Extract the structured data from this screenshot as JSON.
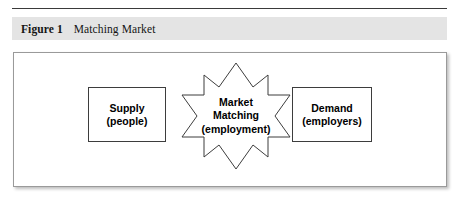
{
  "figure": {
    "caption_label": "Figure 1",
    "caption_title": "Matching Market",
    "band_color": "#e4e4e4",
    "rule_color": "#3a3a3a",
    "frame_border_color": "#9a9a9a"
  },
  "diagram": {
    "type": "flow-diagram",
    "shape_outline_color": "#3d3d3d",
    "shape_fill_color": "#ffffff",
    "text_color": "#000000",
    "nodes": [
      {
        "id": "supply",
        "shape": "rectangle",
        "lines": [
          "Supply",
          "(people)"
        ]
      },
      {
        "id": "matching",
        "shape": "8-point-star",
        "lines": [
          "Market",
          "Matching",
          "(employment)"
        ]
      },
      {
        "id": "demand",
        "shape": "rectangle",
        "lines": [
          "Demand",
          "(employers)"
        ]
      }
    ]
  }
}
